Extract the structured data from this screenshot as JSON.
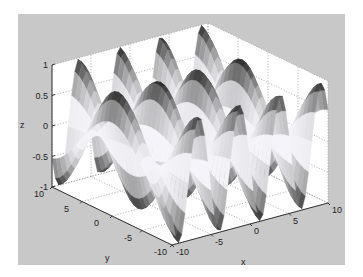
{
  "chart_data": {
    "type": "surface3d",
    "title": "",
    "xlabel": "x",
    "ylabel": "y",
    "zlabel": "z",
    "xlim": [
      -10,
      10
    ],
    "ylim": [
      -10,
      10
    ],
    "zlim": [
      -1,
      1
    ],
    "xticks": [
      "-10",
      "-5",
      "0",
      "5",
      "10"
    ],
    "yticks": [
      "-10",
      "-5",
      "0",
      "5",
      "10"
    ],
    "zticks": [
      "-1",
      "-0.5",
      "0",
      "0.5",
      "1"
    ],
    "grid": true,
    "colormap": "gray (dark at |z|=1, white at z=0)",
    "function_description": "z ≈ sin(x)·cos(y/3)-style ripple: ~3 full oscillations along x, one slow modulation along y",
    "view": "default MATLAB 3D view (az≈-37.5, el≈30)"
  },
  "colors": {
    "figure_background": "#c8c8c8",
    "axes_background": "#ffffff",
    "grid": "#9a9a9a",
    "axis_line": "#333333",
    "surface_dark": "#1e1e1e",
    "surface_light": "#f4f4f4"
  }
}
